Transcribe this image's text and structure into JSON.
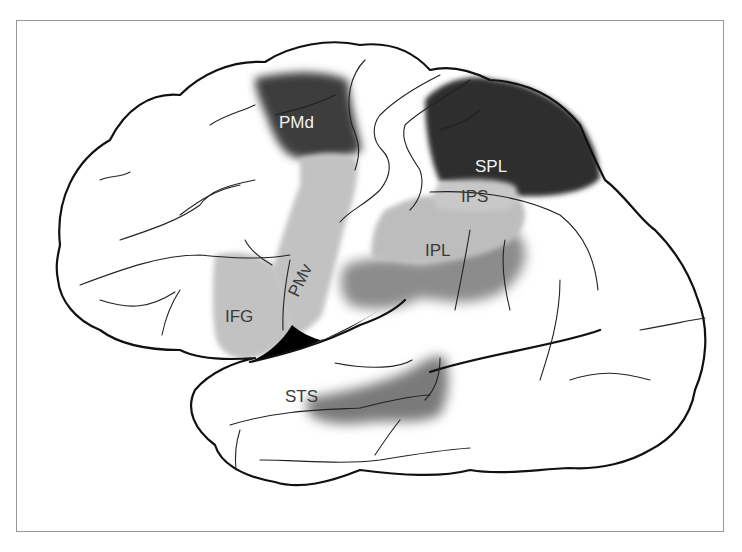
{
  "figure": {
    "type": "lateral view of left cerebral hemisphere",
    "background": "#ffffff",
    "frame_color": "#9a9a9a"
  },
  "regions": [
    {
      "id": "pmd",
      "label": "PMd",
      "shade": "dark",
      "color": "#3c3c3c",
      "label_color": "#f2f2f2"
    },
    {
      "id": "spl",
      "label": "SPL",
      "shade": "dark",
      "color": "#2e2e2e",
      "label_color": "#f2f2f2"
    },
    {
      "id": "ips",
      "label": "IPS",
      "shade": "light",
      "color": "#c4c4c4",
      "label_color": "#3a3a3a"
    },
    {
      "id": "ipl",
      "label": "IPL",
      "shade": "light",
      "color": "#bdbdbd",
      "label_color": "#3a3a3a"
    },
    {
      "id": "pmv",
      "label": "PMv",
      "shade": "light",
      "color": "#c2c2c2",
      "label_color": "#3a3a3a"
    },
    {
      "id": "ifg",
      "label": "IFG",
      "shade": "light",
      "color": "#c2c2c2",
      "label_color": "#3a3a3a"
    },
    {
      "id": "sts",
      "label": "STS",
      "shade": "medium",
      "color": "#7a7a7a",
      "label_color": "#3a3a3a"
    }
  ],
  "extra_shading": [
    {
      "id": "ipl-ventral",
      "color": "#8c8c8c"
    },
    {
      "id": "insula-fissure",
      "color": "#000000"
    }
  ]
}
